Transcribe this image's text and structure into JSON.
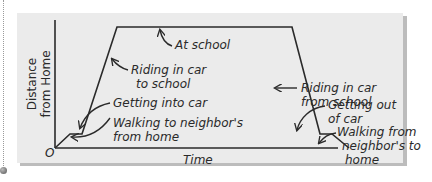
{
  "diagram": {
    "type": "distance-time graph",
    "axes": {
      "y_label_line1": "Distance",
      "y_label_line2": "from Home",
      "x_label": "Time",
      "origin_label": "O"
    },
    "annotations": [
      {
        "id": "walk-to",
        "lines": [
          "Walking to neighbor's",
          "from home"
        ]
      },
      {
        "id": "get-in",
        "lines": [
          "Getting into car"
        ]
      },
      {
        "id": "ride-to",
        "lines": [
          "Riding in car",
          "to school"
        ]
      },
      {
        "id": "at-school",
        "lines": [
          "At school"
        ]
      },
      {
        "id": "ride-from",
        "lines": [
          "Riding in car",
          "from school"
        ]
      },
      {
        "id": "get-out",
        "lines": [
          "Getting out",
          "of car"
        ]
      },
      {
        "id": "walk-from",
        "lines": [
          "Walking from",
          "neighbor's to",
          "home"
        ]
      }
    ],
    "colors": {
      "panel": "#ebebeb",
      "line": "#2a2a2a",
      "shadow": "#bcbcbc"
    }
  }
}
